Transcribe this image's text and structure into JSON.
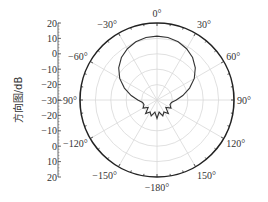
{
  "chart_data": {
    "type": "polar",
    "title": "",
    "ylabel": "方向图/dB",
    "radial_range_db": [
      -30,
      20
    ],
    "radial_ticks": [
      20,
      10,
      0,
      -10,
      -20,
      -30,
      -20,
      -10,
      0,
      10,
      20
    ],
    "angular_ticks_deg": [
      0,
      30,
      60,
      90,
      120,
      150,
      -180,
      -150,
      -120,
      -90,
      -60,
      -30
    ],
    "angular_tick_labels": [
      "0°",
      "30°",
      "60°",
      "90°",
      "120°",
      "150°",
      "−180°",
      "−150°",
      "−120°",
      "−90°",
      "−60°",
      "−30°"
    ],
    "grid": true,
    "series": [
      {
        "name": "pattern",
        "angle_deg": [
          0,
          10,
          20,
          30,
          40,
          50,
          60,
          70,
          80,
          90,
          100,
          110,
          120,
          130,
          140,
          150,
          160,
          170,
          180,
          -170,
          -160,
          -150,
          -140,
          -130,
          -120,
          -110,
          -100,
          -90,
          -80,
          -70,
          -60,
          -50,
          -40,
          -30,
          -20,
          -10
        ],
        "gain_db": [
          11.5,
          11.2,
          10.2,
          8.5,
          6.0,
          2.5,
          -2.0,
          -7.5,
          -13.0,
          -17.5,
          -20.5,
          -21.0,
          -19.5,
          -22.5,
          -18.5,
          -21.0,
          -19.0,
          -22.0,
          -18.0,
          -22.0,
          -19.0,
          -21.0,
          -18.5,
          -22.5,
          -19.5,
          -21.0,
          -20.5,
          -17.5,
          -13.0,
          -7.5,
          -2.0,
          2.5,
          6.0,
          8.5,
          10.2,
          11.2
        ]
      }
    ]
  },
  "axis": {
    "ylabel": "方向图/dB",
    "yticks": [
      "20",
      "10",
      "0",
      "−10",
      "−20",
      "−30",
      "−20",
      "−10",
      "0",
      "10",
      "20"
    ]
  }
}
